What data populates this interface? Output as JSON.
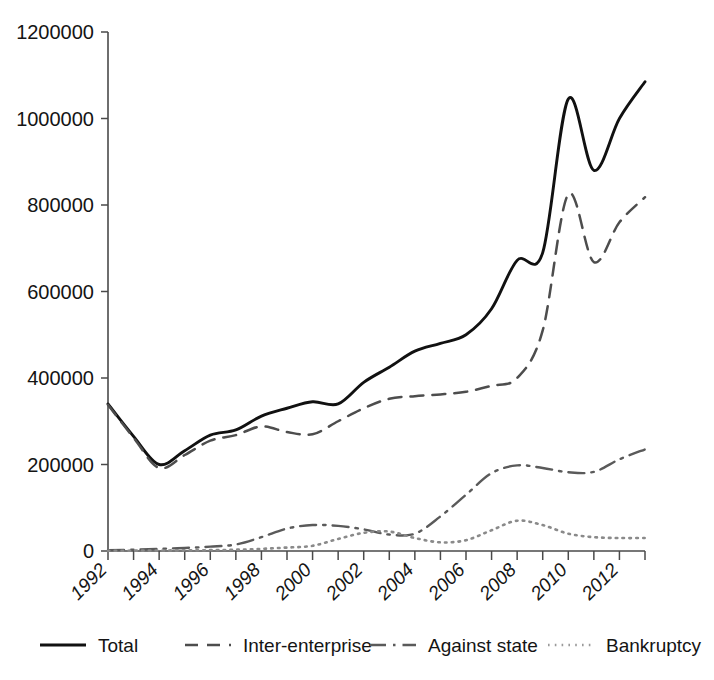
{
  "chart_data": {
    "type": "line",
    "title": "",
    "xlabel": "",
    "ylabel": "",
    "xlim": [
      1992,
      2013
    ],
    "ylim": [
      0,
      1200000
    ],
    "grid": false,
    "legend_position": "bottom",
    "x": [
      1992,
      1993,
      1994,
      1995,
      1996,
      1997,
      1998,
      1999,
      2000,
      2001,
      2002,
      2003,
      2004,
      2005,
      2006,
      2007,
      2008,
      2009,
      2010,
      2011,
      2012,
      2013
    ],
    "y_ticks": [
      0,
      200000,
      400000,
      600000,
      800000,
      1000000,
      1200000
    ],
    "y_tick_labels": [
      "0",
      "200000",
      "400000",
      "600000",
      "800000",
      "1000000",
      "1200000"
    ],
    "x_ticks": [
      1992,
      1993,
      1994,
      1995,
      1996,
      1997,
      1998,
      1999,
      2000,
      2001,
      2002,
      2003,
      2004,
      2005,
      2006,
      2007,
      2008,
      2009,
      2010,
      2011,
      2012,
      2013
    ],
    "x_tick_labels": [
      "1992",
      "1994",
      "1996",
      "1998",
      "2000",
      "2002",
      "2004",
      "2006",
      "2008",
      "2010",
      "2012"
    ],
    "x_tick_label_values": [
      1992,
      1994,
      1996,
      1998,
      2000,
      2002,
      2004,
      2006,
      2008,
      2010,
      2012
    ],
    "series": [
      {
        "name": "Total",
        "style": "solid",
        "color": "#111111",
        "values": [
          340000,
          265000,
          200000,
          232000,
          268000,
          280000,
          312000,
          330000,
          345000,
          340000,
          390000,
          425000,
          462000,
          480000,
          500000,
          560000,
          672000,
          690000,
          1045000,
          880000,
          1000000,
          1085000
        ]
      },
      {
        "name": "Inter-enterprise",
        "style": "dashed",
        "color": "#4d4d4d",
        "values": [
          338000,
          262000,
          192000,
          222000,
          255000,
          268000,
          288000,
          275000,
          270000,
          300000,
          330000,
          352000,
          358000,
          362000,
          368000,
          382000,
          400000,
          510000,
          825000,
          668000,
          760000,
          818000
        ]
      },
      {
        "name": "Against state",
        "style": "dash-dot",
        "color": "#5a5a5a",
        "values": [
          2000,
          3000,
          5000,
          7000,
          10000,
          15000,
          32000,
          52000,
          60000,
          58000,
          50000,
          38000,
          40000,
          80000,
          130000,
          180000,
          198000,
          192000,
          182000,
          183000,
          212000,
          235000
        ]
      },
      {
        "name": "Bankruptcy",
        "style": "dotted",
        "color": "#9a9a9a",
        "values": [
          500,
          800,
          1200,
          1500,
          2000,
          3000,
          5000,
          8000,
          12000,
          28000,
          42000,
          45000,
          30000,
          20000,
          25000,
          48000,
          70000,
          60000,
          40000,
          32000,
          30000,
          30000
        ]
      }
    ]
  },
  "legend": {
    "items": [
      {
        "label": "Total",
        "icon": "solid-line-icon"
      },
      {
        "label": "Inter-enterprise",
        "icon": "dashed-line-icon"
      },
      {
        "label": "Against state",
        "icon": "dash-dot-line-icon"
      },
      {
        "label": "Bankruptcy",
        "icon": "dotted-line-icon"
      }
    ]
  },
  "axis": {
    "y_label_0": "0",
    "y_label_1": "200000",
    "y_label_2": "400000",
    "y_label_3": "600000",
    "y_label_4": "800000",
    "y_label_5": "1000000",
    "y_label_6": "1200000"
  }
}
